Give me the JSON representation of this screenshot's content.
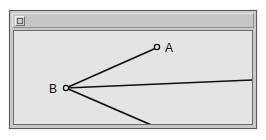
{
  "window": {
    "title": "",
    "menu_button_icon": "window-menu-icon",
    "background_color": "#c9c9c9",
    "border_color": "#5a5a5a",
    "titlebar_color": "#c6c6c6"
  },
  "canvas": {
    "background_color": "#e4e4e4",
    "border_color": "#6b6b6b",
    "width": 238,
    "height": 93
  },
  "diagram": {
    "type": "angle-rays",
    "stroke_color": "#101010",
    "marker_fill": "#e4e4e4",
    "vertex": "B",
    "points": [
      {
        "id": "A",
        "label": "A",
        "x": 143,
        "y": 16,
        "label_x": 151,
        "label_y": 21,
        "marker": true
      },
      {
        "id": "B",
        "label": "B",
        "x": 52,
        "y": 57,
        "label_x": 35,
        "label_y": 62,
        "marker": true
      },
      {
        "id": "C",
        "label": "C",
        "x": 145,
        "y": 97,
        "label_x": 153,
        "label_y": 102,
        "marker": true
      }
    ],
    "segments": [
      {
        "id": "BA",
        "from": "B",
        "to": "A",
        "x1": 52,
        "y1": 57,
        "x2": 140,
        "y2": 18
      },
      {
        "id": "B-ray",
        "from": "B",
        "to": "right-edge",
        "x1": 52,
        "y1": 57,
        "x2": 238,
        "y2": 49
      },
      {
        "id": "BC",
        "from": "B",
        "to": "C",
        "x1": 52,
        "y1": 57,
        "x2": 142,
        "y2": 96
      }
    ]
  }
}
